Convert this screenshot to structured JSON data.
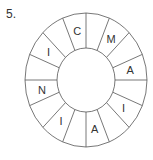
{
  "problem_number": "5.",
  "ring": {
    "segments": [
      "",
      "M",
      "",
      "A",
      "",
      "I",
      "",
      "A",
      "",
      "I",
      "",
      "N",
      "",
      "I",
      "",
      "C"
    ]
  },
  "colors": {
    "stroke": "#555555",
    "text": "#333333"
  }
}
